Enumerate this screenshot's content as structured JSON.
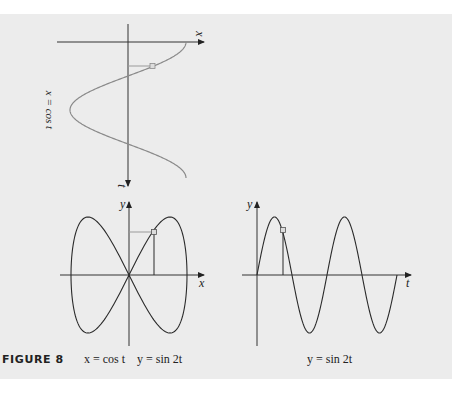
{
  "figure": {
    "label": "FIGURE 8",
    "captions": {
      "left": "x = cos t    y = sin 2t",
      "right": "y = sin 2t"
    },
    "colors": {
      "background_panel": "#ececec",
      "curve_dark": "#2a2a2a",
      "curve_light": "#8a8a8a",
      "guide_line": "#9a9a9a"
    }
  },
  "chart_data": [
    {
      "type": "line",
      "title": "x = cos t",
      "orientation": "t-axis pointing downward, x-axis horizontal",
      "xlabel": "x",
      "ylabel": "t",
      "x_function": "cos t",
      "t_range": [
        0,
        6.283
      ],
      "marker_t": 1.1
    },
    {
      "type": "line",
      "title": "x = cos t, y = sin 2t",
      "xlabel": "x",
      "ylabel": "y",
      "parametric": {
        "x": "cos t",
        "y": "sin 2t"
      },
      "t_range": [
        0,
        6.283
      ],
      "xlim": [
        -1,
        1
      ],
      "ylim": [
        -1,
        1
      ],
      "marker_t": 1.1
    },
    {
      "type": "line",
      "title": "y = sin 2t",
      "xlabel": "t",
      "ylabel": "y",
      "y_function": "sin 2t",
      "t_range": [
        0,
        6.283
      ],
      "ylim": [
        -1,
        1
      ],
      "marker_t": 1.1
    }
  ],
  "axes_labels": {
    "top_x": "x",
    "top_t": "t",
    "top_curve_label": "x = cos t",
    "bl_y": "y",
    "bl_x": "x",
    "br_y": "y",
    "br_t": "t"
  }
}
